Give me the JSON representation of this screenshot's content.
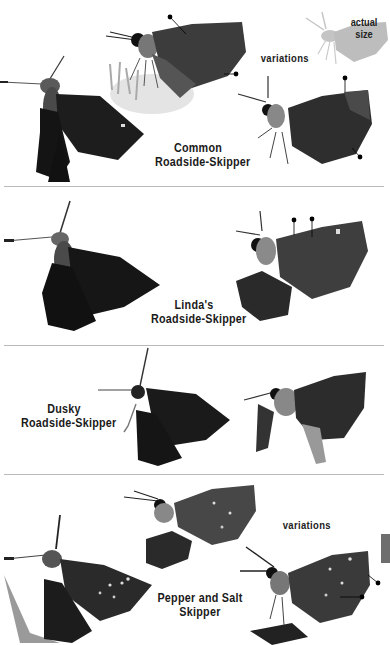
{
  "page": {
    "type": "field-guide-plate",
    "thumb_tab_color": "#6e6e6e",
    "divider_color": "#b9b9b9"
  },
  "actual_size": {
    "label_line1": "actual",
    "label_line2": "size",
    "silhouette_color": "#bdbdbd"
  },
  "species": [
    {
      "name_line1": "Common",
      "name_line2": "Roadside-Skipper",
      "variations_label": "variations",
      "photos": [
        "dorsal-view",
        "ventral-view-on-flower",
        "ventral-view-variation"
      ],
      "field_mark_pointers": 4
    },
    {
      "name_line1": "Linda's",
      "name_line2": "Roadside-Skipper",
      "photos": [
        "dorsal-view",
        "ventral-view"
      ],
      "field_mark_pointers": 2
    },
    {
      "name_line1": "Dusky",
      "name_line2": "Roadside-Skipper",
      "photos": [
        "dorsal-view",
        "ventral-view"
      ],
      "field_mark_pointers": 0
    },
    {
      "name_line1": "Pepper and Salt",
      "name_line2": "Skipper",
      "variations_label": "variations",
      "photos": [
        "dorsal-view",
        "ventral-view",
        "ventral-view-variation"
      ],
      "field_mark_pointers": 2
    }
  ]
}
